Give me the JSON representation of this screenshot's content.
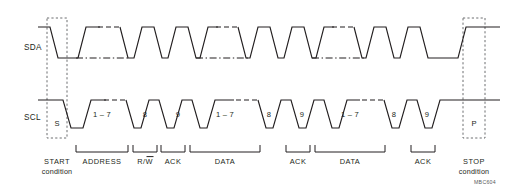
{
  "figure": {
    "type": "i2c-bus-protocol-timing-diagram",
    "figure_code": "MBC604",
    "colors": {
      "waveform": "#231f20",
      "condition_box": "#6d6e71",
      "background": "#ffffff"
    }
  },
  "signals": [
    {
      "id": "sda",
      "name": "SDA",
      "high_y": 27,
      "low_y": 58
    },
    {
      "id": "scl",
      "name": "SCL",
      "high_y": 100,
      "low_y": 128
    }
  ],
  "markers": [
    {
      "id": "start-marker",
      "label": "S",
      "x": 57,
      "y": 123
    },
    {
      "id": "stop-marker",
      "label": "P",
      "x": 474,
      "y": 123
    }
  ],
  "bit_labels": [
    {
      "id": "address-bits",
      "label": "1 – 7",
      "x": 102
    },
    {
      "id": "address-bit8",
      "label": "8",
      "x": 145
    },
    {
      "id": "address-ack",
      "label": "9",
      "x": 173
    },
    {
      "id": "data1-bits",
      "label": "1 – 7",
      "x": 225
    },
    {
      "id": "data1-bit8",
      "label": "8",
      "x": 269
    },
    {
      "id": "data1-ack",
      "label": "9",
      "x": 298
    },
    {
      "id": "data2-bits",
      "label": "1 – 7",
      "x": 350
    },
    {
      "id": "data2-bit8",
      "label": "8",
      "x": 394
    },
    {
      "id": "data2-ack",
      "label": "9",
      "x": 423
    }
  ],
  "field_brackets": [
    {
      "id": "address",
      "label": "ADDRESS",
      "x1": 76,
      "x2": 128,
      "overbar": null
    },
    {
      "id": "rw",
      "label": "R/W",
      "x1": 133,
      "x2": 157,
      "overbar": "W"
    },
    {
      "id": "ack1",
      "label": "ACK",
      "x1": 161,
      "x2": 185,
      "overbar": null
    },
    {
      "id": "data1",
      "label": "DATA",
      "x1": 190,
      "x2": 260,
      "overbar": null
    },
    {
      "id": "ack2",
      "label": "ACK",
      "x1": 286,
      "x2": 310,
      "overbar": null
    },
    {
      "id": "data2",
      "label": "DATA",
      "x1": 315,
      "x2": 385,
      "overbar": null
    },
    {
      "id": "ack3",
      "label": "ACK",
      "x1": 411,
      "x2": 435,
      "overbar": null
    }
  ],
  "conditions": [
    {
      "id": "start-condition",
      "line1": "START",
      "line2": "condition",
      "box": {
        "x": 47,
        "y": 18,
        "width": 20,
        "height": 120
      },
      "label_x": 57
    },
    {
      "id": "stop-condition",
      "line1": "STOP",
      "line2": "condition",
      "box": {
        "x": 463,
        "y": 18,
        "width": 22,
        "height": 120
      },
      "label_x": 474
    }
  ],
  "waveform_paths": {
    "sda_solid_segments": [
      "M 40 27 L 50 27 L 58 58 L 76 58",
      "M 76 58 L 84 27 L 98 27",
      "M 120 27 L 128 58 L 134 58 L 140 27 L 152 27 L 158 58 L 164 58 L 170 27 L 182 27 L 188 58 L 196 58 L 202 27 L 216 27",
      "M 238 27 L 244 58 L 248 58 L 254 27 L 268 27 L 274 58 L 280 58 L 286 27 L 298 27 L 304 58 L 312 58 L 318 27 L 332 27",
      "M 354 27 L 360 58 L 364 58 L 370 27 L 384 27 L 390 58 L 396 58 L 402 27 L 414 27 L 420 58 L 428 58 L 434 58 L 440 58 L 448 58 L 458 58 L 466 27 L 500 27"
    ],
    "sda_dashed_segments": [
      "M 98 27 L 120 27",
      "M 216 27 L 238 27",
      "M 332 27 L 354 27"
    ],
    "sda_dashdot_segments": [
      "M 76 58 L 128 58",
      "M 196 58 L 248 58",
      "M 312 58 L 364 58"
    ],
    "scl_solid_segments": [
      "M 40 100 L 62 100 L 70 128 L 82 128 L 90 100 L 104 100",
      "M 126 100 L 134 128 L 140 128 L 148 100 L 158 100 L 166 128 L 172 128 L 180 100 L 190 100 L 198 128 L 206 128",
      "M 214 128 L 222 100 L 236 100",
      "M 258 100 L 266 128 L 272 128 L 280 100 L 290 100 L 298 128 L 304 128 L 312 100 L 322 100 L 330 128 L 338 128",
      "M 340 128 L 348 100 L 362 100",
      "M 384 100 L 392 128 L 398 128 L 406 100 L 416 100 L 424 128 L 430 128 L 438 100 L 448 100 L 456 100 L 470 100 L 500 100"
    ],
    "scl_dashed_segments": [
      "M 104 100 L 126 100",
      "M 236 100 L 258 100",
      "M 362 100 L 384 100"
    ]
  }
}
